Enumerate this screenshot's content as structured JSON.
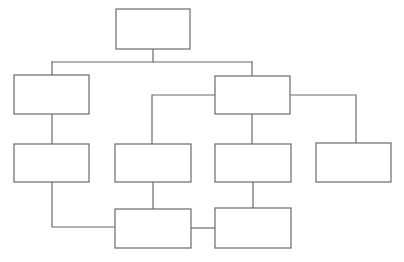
{
  "diagram": {
    "type": "flowchart",
    "title": "",
    "background_color": "#ffffff",
    "line_color": "#6b6b6b",
    "node_fill_color": "#ffffff",
    "node_border_color": "#6b6b6b",
    "line_width": 1.2,
    "canvas": {
      "width": 404,
      "height": 262
    },
    "nodes": [
      {
        "id": "node-1",
        "label": "",
        "x": 116,
        "y": 9,
        "w": 74,
        "h": 40
      },
      {
        "id": "node-2",
        "label": "",
        "x": 14,
        "y": 75,
        "w": 75,
        "h": 39
      },
      {
        "id": "node-3",
        "label": "",
        "x": 215,
        "y": 76,
        "w": 75,
        "h": 38
      },
      {
        "id": "node-4",
        "label": "",
        "x": 14,
        "y": 144,
        "w": 75,
        "h": 38
      },
      {
        "id": "node-5",
        "label": "",
        "x": 115,
        "y": 144,
        "w": 76,
        "h": 38
      },
      {
        "id": "node-6",
        "label": "",
        "x": 215,
        "y": 144,
        "w": 76,
        "h": 38
      },
      {
        "id": "node-7",
        "label": "",
        "x": 316,
        "y": 143,
        "w": 75,
        "h": 39
      },
      {
        "id": "node-8",
        "label": "",
        "x": 115,
        "y": 209,
        "w": 76,
        "h": 39
      },
      {
        "id": "node-9",
        "label": "",
        "x": 215,
        "y": 208,
        "w": 76,
        "h": 40
      }
    ],
    "connectors": [
      {
        "id": "conn-root-stem",
        "from": "node-1",
        "to": "bus",
        "path": "M 153 49 L 153 62"
      },
      {
        "id": "conn-top-bus",
        "from": "bus",
        "to": "bus",
        "path": "M 52 62 L 252 62"
      },
      {
        "id": "conn-bus-to-node2",
        "from": "bus",
        "to": "node-2",
        "path": "M 52 62 L 52 75"
      },
      {
        "id": "conn-bus-to-node3",
        "from": "bus",
        "to": "node-3",
        "path": "M 252 62 L 252 76"
      },
      {
        "id": "conn-node2-to-node4",
        "from": "node-2",
        "to": "node-4",
        "path": "M 52 114 L 52 144"
      },
      {
        "id": "conn-node4-to-node8",
        "from": "node-4",
        "to": "node-8",
        "path": "M 52 182 L 52 227 L 115 227"
      },
      {
        "id": "conn-node3-left-branch",
        "from": "node-3",
        "to": "node-5",
        "path": "M 215 95 L 152 95 L 152 144"
      },
      {
        "id": "conn-node3-to-node6",
        "from": "node-3",
        "to": "node-6",
        "path": "M 252 114 L 252 144"
      },
      {
        "id": "conn-node3-right-branch",
        "from": "node-3",
        "to": "node-7",
        "path": "M 290 95 L 356 95 L 356 143"
      },
      {
        "id": "conn-node5-to-node8",
        "from": "node-5",
        "to": "node-8",
        "path": "M 153 182 L 153 209"
      },
      {
        "id": "conn-node6-to-node9",
        "from": "node-6",
        "to": "node-9",
        "path": "M 253 182 L 253 208"
      },
      {
        "id": "conn-node8-to-node9",
        "from": "node-8",
        "to": "node-9",
        "path": "M 191 228 L 215 228"
      }
    ]
  }
}
